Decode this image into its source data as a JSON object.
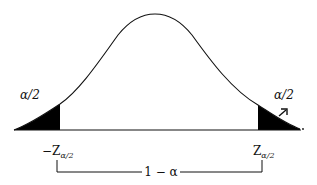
{
  "diagram": {
    "type": "normal-distribution-two-tailed",
    "colors": {
      "ink": "#111111",
      "background": "#ffffff",
      "tail_fill": "#000000"
    },
    "left_tail": {
      "area_label": "α/2",
      "critical_value_label": "−Z",
      "critical_value_subscript": "α/2"
    },
    "right_tail": {
      "area_label": "α/2",
      "critical_value_label": "Z",
      "critical_value_subscript": "α/2"
    },
    "center_region": {
      "label": "1 − α"
    }
  }
}
